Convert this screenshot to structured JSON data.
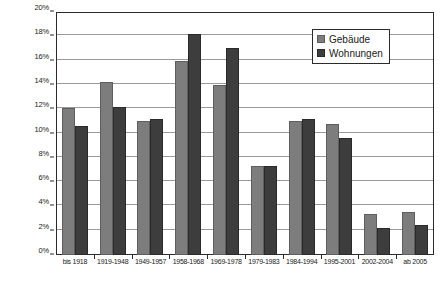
{
  "chart_data": {
    "type": "bar",
    "title": "",
    "subtitle": "",
    "xlabel": "",
    "ylabel": "",
    "ylim": [
      0,
      20
    ],
    "ytick_step": 2,
    "ytick_labels": [
      "0%",
      "2%",
      "4%",
      "6%",
      "8%",
      "10%",
      "12%",
      "14%",
      "16%",
      "18%",
      "20%"
    ],
    "ytick_values": [
      0,
      2,
      4,
      6,
      8,
      10,
      12,
      14,
      16,
      18,
      20
    ],
    "grid": true,
    "legend_position": "top-right",
    "categories": [
      "bis 1918",
      "1919-1948",
      "1949-1957",
      "1958-1968",
      "1969-1978",
      "1979-1983",
      "1984-1994",
      "1995-2001",
      "2002-2004",
      "ab 2005"
    ],
    "series": [
      {
        "name": "Gebäude",
        "color": "#7d7d7d",
        "values": [
          12.1,
          14.2,
          11.0,
          16.0,
          14.0,
          7.3,
          11.0,
          10.8,
          3.4,
          3.5
        ]
      },
      {
        "name": "Wohnungen",
        "color": "#3d3d3d",
        "values": [
          10.6,
          12.2,
          11.2,
          18.2,
          17.0,
          7.3,
          11.2,
          9.6,
          2.2,
          2.5
        ]
      }
    ]
  },
  "legend": {
    "items": [
      {
        "label": "Gebäude",
        "swatch": "gebaeude-swatch"
      },
      {
        "label": "Wohnungen",
        "swatch": "wohnungen-swatch"
      }
    ]
  }
}
